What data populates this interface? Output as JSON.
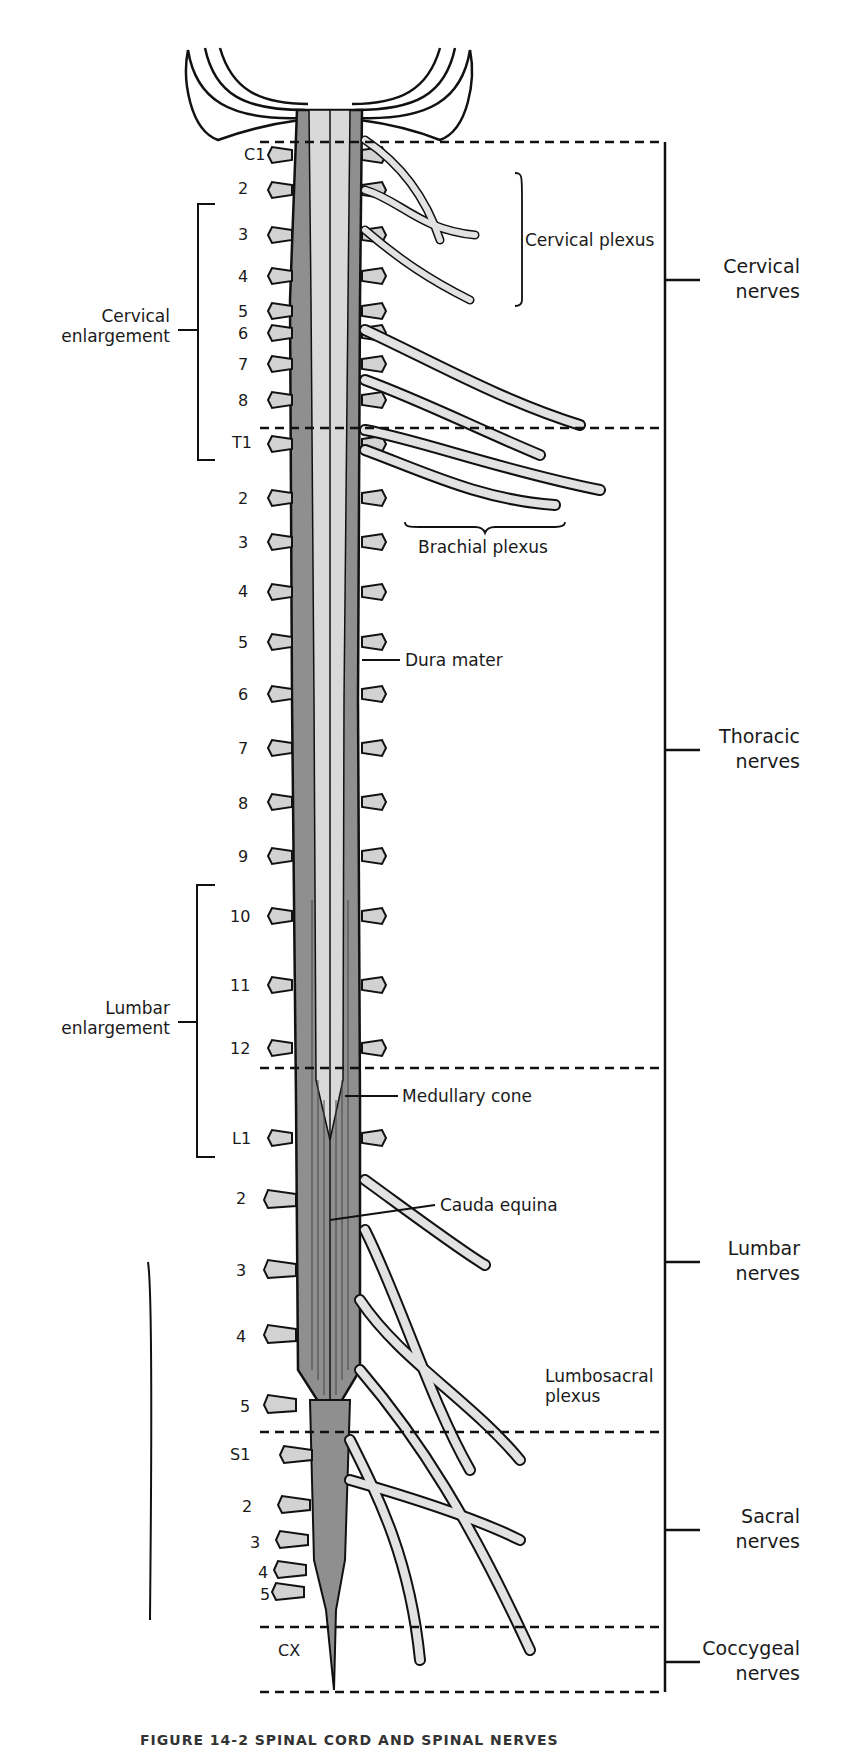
{
  "figure": {
    "caption_partial": "FIGURE 14-2 SPINAL CORD AND SPINAL NERVES",
    "colors": {
      "dura": "#8f8f8f",
      "cord": "#d9d9d9",
      "nerve": "#e2e2e2",
      "outline": "#111111",
      "background": "#ffffff"
    }
  },
  "segments": {
    "cervical": [
      "C1",
      "2",
      "3",
      "4",
      "5",
      "6",
      "7",
      "8"
    ],
    "thoracic": [
      "T1",
      "2",
      "3",
      "4",
      "5",
      "6",
      "7",
      "8",
      "9",
      "10",
      "11",
      "12"
    ],
    "lumbar": [
      "L1",
      "2",
      "3",
      "4",
      "5"
    ],
    "sacral": [
      "S1",
      "2",
      "3",
      "4",
      "5"
    ],
    "coccygeal": [
      "CX"
    ]
  },
  "left_labels": {
    "cervical_enlargement": {
      "line1": "Cervical",
      "line2": "enlargement"
    },
    "lumbar_enlargement": {
      "line1": "Lumbar",
      "line2": "enlargement"
    }
  },
  "inner_labels": {
    "cervical_plexus": "Cervical plexus",
    "brachial_plexus": "Brachial plexus",
    "dura_mater": "Dura mater",
    "medullary_cone": "Medullary cone",
    "cauda_equina": "Cauda equina",
    "lumbosacral_plexus": {
      "line1": "Lumbosacral",
      "line2": "plexus"
    }
  },
  "right_groups": [
    {
      "line1": "Cervical",
      "line2": "nerves"
    },
    {
      "line1": "Thoracic",
      "line2": "nerves"
    },
    {
      "line1": "Lumbar",
      "line2": "nerves"
    },
    {
      "line1": "Sacral",
      "line2": "nerves"
    },
    {
      "line1": "Coccygeal",
      "line2": "nerves"
    }
  ]
}
